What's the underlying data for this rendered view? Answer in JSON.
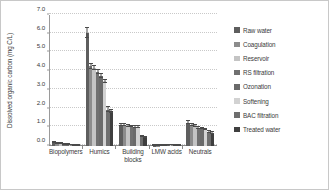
{
  "chart_data": {
    "type": "bar",
    "title": "",
    "xlabel": "",
    "ylabel": "Dissolved organic carbon (mg C/L)",
    "ylim": [
      0.0,
      7.0
    ],
    "ytick_step": 1.0,
    "ytick_labels": [
      "0.0",
      "1.0",
      "2.0",
      "3.0",
      "4.0",
      "5.0",
      "6.0",
      "7.0"
    ],
    "grid": true,
    "legend_position": "right",
    "error_bars": true,
    "categories": [
      "Biopolymers",
      "Humics",
      "Building blocks",
      "LMW acids",
      "Neutrals"
    ],
    "series": [
      {
        "name": "Raw water",
        "color": "#5e5e5e",
        "values": [
          0.17,
          6.05,
          1.14,
          0.02,
          1.25
        ],
        "errors": [
          0.03,
          0.28,
          0.06,
          0.01,
          0.07
        ]
      },
      {
        "name": "Coagulation",
        "color": "#8c8c8c",
        "values": [
          0.14,
          4.25,
          1.12,
          0.02,
          1.12
        ],
        "errors": [
          0.03,
          0.12,
          0.05,
          0.01,
          0.05
        ]
      },
      {
        "name": "Reservoir",
        "color": "#c4c4c4",
        "values": [
          0.12,
          4.18,
          1.05,
          0.03,
          1.05
        ],
        "errors": [
          0.02,
          0.11,
          0.05,
          0.01,
          0.05
        ]
      },
      {
        "name": "RS filtration",
        "color": "#707070",
        "values": [
          0.1,
          3.95,
          1.03,
          0.03,
          0.98
        ],
        "errors": [
          0.02,
          0.1,
          0.04,
          0.01,
          0.05
        ]
      },
      {
        "name": "Ozonation",
        "color": "#6a6a6a",
        "values": [
          0.07,
          3.75,
          1.02,
          0.04,
          0.93
        ],
        "errors": [
          0.02,
          0.1,
          0.05,
          0.01,
          0.04
        ]
      },
      {
        "name": "Softening",
        "color": "#d2d2d2",
        "values": [
          0.05,
          3.45,
          1.0,
          0.04,
          0.88
        ],
        "errors": [
          0.02,
          0.09,
          0.05,
          0.01,
          0.04
        ]
      },
      {
        "name": "BAC filtration",
        "color": "#6e6e6e",
        "values": [
          0.03,
          1.95,
          0.5,
          0.03,
          0.74
        ],
        "errors": [
          0.01,
          0.12,
          0.04,
          0.01,
          0.05
        ]
      },
      {
        "name": "Treated water",
        "color": "#3f3f3f",
        "values": [
          0.03,
          1.85,
          0.46,
          0.03,
          0.7
        ],
        "errors": [
          0.01,
          0.1,
          0.03,
          0.01,
          0.04
        ]
      }
    ]
  }
}
